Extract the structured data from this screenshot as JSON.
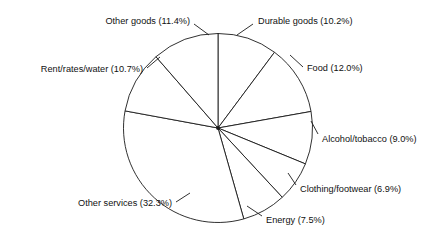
{
  "chart_data": {
    "type": "pie",
    "title": "",
    "subtitle": "",
    "xlabel": "",
    "ylabel": "",
    "legend_position": "none",
    "grid": false,
    "value_unit": "%",
    "total": 100.0,
    "categories": [
      "Durable goods",
      "Food",
      "Alcohol/tobacco",
      "Clothing/footwear",
      "Energy",
      "Other services",
      "Rent/rates/water",
      "Other goods"
    ],
    "values": [
      10.2,
      12.0,
      9.0,
      6.9,
      7.5,
      32.3,
      10.7,
      11.4
    ],
    "slices": [
      {
        "name": "Durable goods",
        "value": 10.2,
        "label": "Durable goods (10.2%)",
        "start_angle": 0.0,
        "end_angle": 36.72,
        "label_x": 258,
        "label_y": 22,
        "label_anchor": "start",
        "leader": "M 253 24 L 237 35"
      },
      {
        "name": "Food",
        "value": 12.0,
        "label": "Food (12.0%)",
        "start_angle": 36.72,
        "end_angle": 79.92,
        "label_x": 307,
        "label_y": 69,
        "label_anchor": "start",
        "leader": "M 303 67 L 290 55"
      },
      {
        "name": "Alcohol/tobacco",
        "value": 9.0,
        "label": "Alcohol/tobacco (9.0%)",
        "start_angle": 79.92,
        "end_angle": 112.32,
        "label_x": 322,
        "label_y": 140,
        "label_anchor": "start",
        "leader": "M 318 134 L 311 121"
      },
      {
        "name": "Clothing/footwear",
        "value": 6.9,
        "label": "Clothing/footwear (6.9%)",
        "start_angle": 112.32,
        "end_angle": 137.16,
        "label_x": 300,
        "label_y": 190,
        "label_anchor": "start",
        "leader": "M 296 185 L 288 173"
      },
      {
        "name": "Energy",
        "value": 7.5,
        "label": "Energy (7.5%)",
        "start_angle": 137.16,
        "end_angle": 164.16,
        "label_x": 266,
        "label_y": 221,
        "label_anchor": "start",
        "leader": "M 262 216 L 247 206"
      },
      {
        "name": "Other services",
        "value": 32.3,
        "label": "Other services (32.3%)",
        "start_angle": 164.16,
        "end_angle": 280.44,
        "label_x": 172,
        "label_y": 204,
        "label_anchor": "end",
        "leader": "M 176 202 L 190 193"
      },
      {
        "name": "Rent/rates/water",
        "value": 10.7,
        "label": "Rent/rates/water (10.7%)",
        "start_angle": 280.44,
        "end_angle": 318.96,
        "label_x": 143,
        "label_y": 70,
        "label_anchor": "end",
        "leader": "M 147 68 L 160 57"
      },
      {
        "name": "Other goods",
        "value": 11.4,
        "label": "Other goods (11.4%)",
        "start_angle": 318.96,
        "end_angle": 360.0,
        "label_x": 190,
        "label_y": 22,
        "label_anchor": "end",
        "leader": "M 194 24 L 209 35"
      }
    ],
    "geometry": {
      "center_x": 218,
      "center_y": 128,
      "radius": 94.5
    },
    "colors": {
      "slice_fill": "#ffffff",
      "stroke": "#1a1a1a",
      "label_text": "#111111",
      "background": "#ffffff"
    }
  }
}
